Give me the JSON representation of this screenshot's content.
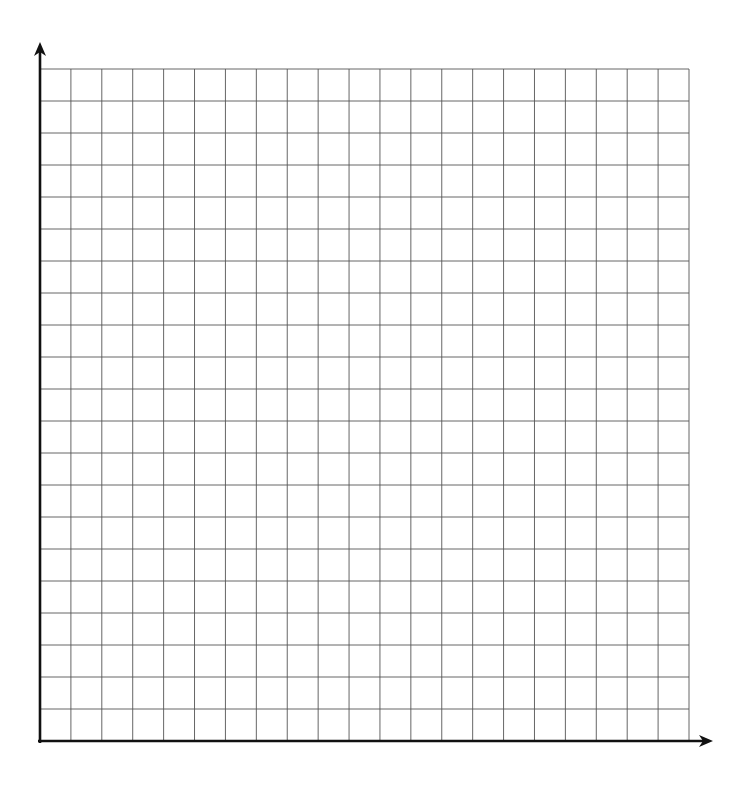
{
  "diagram": {
    "type": "blank-coordinate-grid",
    "grid": {
      "columns": 21,
      "rows": 21,
      "left": 40,
      "right": 689,
      "top": 69,
      "bottom": 741,
      "line_color": "#555555",
      "line_width": 0.9
    },
    "x_axis": {
      "y": 741,
      "x_start": 38,
      "arrow_tip_x": 713,
      "color": "#111111",
      "width": 2.6,
      "label": ""
    },
    "y_axis": {
      "x": 40,
      "y_start": 743,
      "arrow_tip_y": 42,
      "color": "#111111",
      "width": 2.6,
      "label": ""
    },
    "background": "#ffffff"
  }
}
